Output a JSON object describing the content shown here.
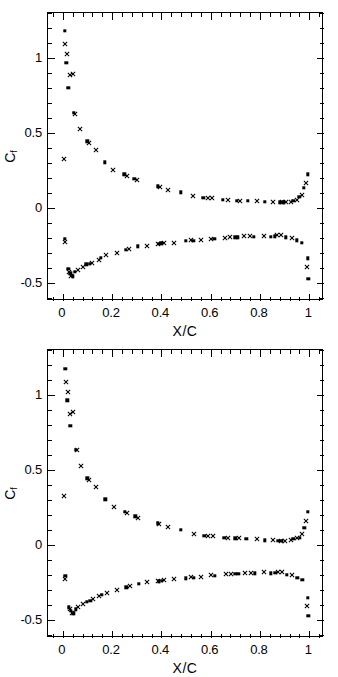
{
  "figure": {
    "background": "#ffffff",
    "foreground": "#000000"
  },
  "chart_data": [
    {
      "type": "scatter",
      "panel": "top",
      "title": "",
      "xlabel": "X/C",
      "ylabel": "Cf",
      "ylabel_base": "C",
      "ylabel_sub": "f",
      "xlim": [
        -0.06,
        1.06
      ],
      "ylim": [
        -0.62,
        1.3
      ],
      "xticks": [
        0,
        0.2,
        0.4,
        0.6,
        0.8,
        1
      ],
      "xticklabels": [
        "0",
        "0.2",
        "0.4",
        "0.6",
        "0.8",
        "1"
      ],
      "yticks": [
        -0.5,
        0,
        0.5,
        1
      ],
      "yticklabels": [
        "-0.5",
        "0",
        "0.5",
        "1"
      ],
      "minor_x_per_major": 5,
      "minor_y_per_major": 5,
      "grid": false,
      "legend": null,
      "series": [
        {
          "name": "squares-upper",
          "marker": "square",
          "points": [
            [
              0.008,
              1.18
            ],
            [
              0.015,
              0.97
            ],
            [
              0.022,
              0.8
            ],
            [
              0.045,
              0.635
            ],
            [
              0.1,
              0.445
            ],
            [
              0.17,
              0.305
            ],
            [
              0.25,
              0.225
            ],
            [
              0.29,
              0.195
            ],
            [
              0.385,
              0.145
            ],
            [
              0.48,
              0.105
            ],
            [
              0.57,
              0.07
            ],
            [
              0.65,
              0.055
            ],
            [
              0.705,
              0.05
            ],
            [
              0.75,
              0.048
            ],
            [
              0.82,
              0.04
            ],
            [
              0.88,
              0.038
            ],
            [
              0.895,
              0.038
            ],
            [
              0.935,
              0.05
            ],
            [
              0.96,
              0.075
            ],
            [
              0.978,
              0.135
            ],
            [
              0.995,
              0.225
            ]
          ]
        },
        {
          "name": "crosses-upper",
          "marker": "cross",
          "points": [
            [
              0.004,
              0.325
            ],
            [
              0.01,
              1.095
            ],
            [
              0.016,
              1.025
            ],
            [
              0.028,
              0.885
            ],
            [
              0.04,
              0.895
            ],
            [
              0.05,
              0.63
            ],
            [
              0.07,
              0.525
            ],
            [
              0.105,
              0.435
            ],
            [
              0.135,
              0.385
            ],
            [
              0.205,
              0.255
            ],
            [
              0.26,
              0.215
            ],
            [
              0.3,
              0.185
            ],
            [
              0.395,
              0.142
            ],
            [
              0.425,
              0.122
            ],
            [
              0.53,
              0.08
            ],
            [
              0.59,
              0.07
            ],
            [
              0.605,
              0.068
            ],
            [
              0.67,
              0.052
            ],
            [
              0.72,
              0.05
            ],
            [
              0.79,
              0.045
            ],
            [
              0.855,
              0.04
            ],
            [
              0.89,
              0.038
            ],
            [
              0.905,
              0.038
            ],
            [
              0.925,
              0.042
            ],
            [
              0.95,
              0.055
            ],
            [
              0.97,
              0.09
            ],
            [
              0.985,
              0.165
            ]
          ]
        },
        {
          "name": "squares-lower",
          "marker": "square",
          "points": [
            [
              0.008,
              -0.205
            ],
            [
              0.022,
              -0.405
            ],
            [
              0.03,
              -0.435
            ],
            [
              0.04,
              -0.455
            ],
            [
              0.05,
              -0.425
            ],
            [
              0.095,
              -0.375
            ],
            [
              0.11,
              -0.37
            ],
            [
              0.155,
              -0.33
            ],
            [
              0.255,
              -0.28
            ],
            [
              0.305,
              -0.255
            ],
            [
              0.39,
              -0.24
            ],
            [
              0.4,
              -0.235
            ],
            [
              0.5,
              -0.22
            ],
            [
              0.53,
              -0.218
            ],
            [
              0.615,
              -0.205
            ],
            [
              0.7,
              -0.195
            ],
            [
              0.71,
              -0.195
            ],
            [
              0.775,
              -0.19
            ],
            [
              0.845,
              -0.19
            ],
            [
              0.86,
              -0.188
            ],
            [
              0.905,
              -0.195
            ],
            [
              0.95,
              -0.215
            ],
            [
              0.97,
              -0.23
            ],
            [
              0.995,
              -0.335
            ],
            [
              0.997,
              -0.47
            ]
          ]
        },
        {
          "name": "crosses-lower",
          "marker": "cross",
          "points": [
            [
              0.008,
              -0.225
            ],
            [
              0.026,
              -0.425
            ],
            [
              0.035,
              -0.45
            ],
            [
              0.06,
              -0.41
            ],
            [
              0.08,
              -0.39
            ],
            [
              0.12,
              -0.365
            ],
            [
              0.145,
              -0.345
            ],
            [
              0.175,
              -0.315
            ],
            [
              0.22,
              -0.3
            ],
            [
              0.27,
              -0.275
            ],
            [
              0.34,
              -0.25
            ],
            [
              0.385,
              -0.243
            ],
            [
              0.41,
              -0.235
            ],
            [
              0.45,
              -0.23
            ],
            [
              0.52,
              -0.215
            ],
            [
              0.56,
              -0.212
            ],
            [
              0.6,
              -0.205
            ],
            [
              0.66,
              -0.198
            ],
            [
              0.68,
              -0.195
            ],
            [
              0.735,
              -0.188
            ],
            [
              0.76,
              -0.188
            ],
            [
              0.815,
              -0.185
            ],
            [
              0.87,
              -0.182
            ],
            [
              0.885,
              -0.182
            ],
            [
              0.93,
              -0.2
            ],
            [
              0.99,
              -0.39
            ]
          ]
        }
      ]
    },
    {
      "type": "scatter",
      "panel": "bottom",
      "title": "",
      "xlabel": "X/C",
      "ylabel": "Cf",
      "ylabel_base": "C",
      "ylabel_sub": "f",
      "xlim": [
        -0.06,
        1.06
      ],
      "ylim": [
        -0.62,
        1.3
      ],
      "xticks": [
        0,
        0.2,
        0.4,
        0.6,
        0.8,
        1
      ],
      "xticklabels": [
        "0",
        "0.2",
        "0.4",
        "0.6",
        "0.8",
        "1"
      ],
      "yticks": [
        -0.5,
        0,
        0.5,
        1
      ],
      "yticklabels": [
        "-0.5",
        "0",
        "0.5",
        "1"
      ],
      "minor_x_per_major": 5,
      "minor_y_per_major": 5,
      "grid": false,
      "legend": null,
      "series": [
        {
          "name": "squares-upper",
          "marker": "square",
          "points": [
            [
              0.01,
              1.175
            ],
            [
              0.018,
              0.965
            ],
            [
              0.03,
              0.795
            ],
            [
              0.052,
              0.635
            ],
            [
              0.1,
              0.445
            ],
            [
              0.172,
              0.305
            ],
            [
              0.252,
              0.222
            ],
            [
              0.295,
              0.192
            ],
            [
              0.385,
              0.145
            ],
            [
              0.48,
              0.1
            ],
            [
              0.575,
              0.062
            ],
            [
              0.655,
              0.05
            ],
            [
              0.7,
              0.045
            ],
            [
              0.745,
              0.042
            ],
            [
              0.82,
              0.032
            ],
            [
              0.875,
              0.03
            ],
            [
              0.89,
              0.03
            ],
            [
              0.935,
              0.042
            ],
            [
              0.962,
              0.048
            ],
            [
              0.98,
              0.115
            ],
            [
              0.995,
              0.222
            ]
          ]
        },
        {
          "name": "crosses-upper",
          "marker": "cross",
          "points": [
            [
              0.004,
              0.325
            ],
            [
              0.012,
              1.09
            ],
            [
              0.02,
              1.02
            ],
            [
              0.028,
              0.875
            ],
            [
              0.042,
              0.885
            ],
            [
              0.058,
              0.632
            ],
            [
              0.072,
              0.525
            ],
            [
              0.105,
              0.435
            ],
            [
              0.135,
              0.385
            ],
            [
              0.208,
              0.255
            ],
            [
              0.262,
              0.212
            ],
            [
              0.305,
              0.182
            ],
            [
              0.392,
              0.142
            ],
            [
              0.428,
              0.118
            ],
            [
              0.532,
              0.072
            ],
            [
              0.59,
              0.062
            ],
            [
              0.61,
              0.06
            ],
            [
              0.67,
              0.048
            ],
            [
              0.715,
              0.045
            ],
            [
              0.79,
              0.038
            ],
            [
              0.855,
              0.032
            ],
            [
              0.885,
              0.03
            ],
            [
              0.9,
              0.03
            ],
            [
              0.928,
              0.035
            ],
            [
              0.952,
              0.045
            ],
            [
              0.972,
              0.075
            ],
            [
              0.988,
              0.16
            ]
          ]
        },
        {
          "name": "squares-lower",
          "marker": "square",
          "points": [
            [
              0.01,
              -0.205
            ],
            [
              0.024,
              -0.415
            ],
            [
              0.032,
              -0.44
            ],
            [
              0.042,
              -0.455
            ],
            [
              0.052,
              -0.428
            ],
            [
              0.098,
              -0.378
            ],
            [
              0.112,
              -0.372
            ],
            [
              0.158,
              -0.332
            ],
            [
              0.258,
              -0.282
            ],
            [
              0.308,
              -0.258
            ],
            [
              0.39,
              -0.242
            ],
            [
              0.402,
              -0.238
            ],
            [
              0.5,
              -0.222
            ],
            [
              0.532,
              -0.218
            ],
            [
              0.618,
              -0.205
            ],
            [
              0.7,
              -0.192
            ],
            [
              0.712,
              -0.192
            ],
            [
              0.778,
              -0.188
            ],
            [
              0.845,
              -0.188
            ],
            [
              0.862,
              -0.186
            ],
            [
              0.908,
              -0.198
            ],
            [
              0.952,
              -0.218
            ],
            [
              0.972,
              -0.232
            ],
            [
              0.995,
              -0.352
            ],
            [
              0.997,
              -0.472
            ]
          ]
        },
        {
          "name": "crosses-lower",
          "marker": "cross",
          "points": [
            [
              0.01,
              -0.228
            ],
            [
              0.028,
              -0.428
            ],
            [
              0.038,
              -0.452
            ],
            [
              0.062,
              -0.412
            ],
            [
              0.082,
              -0.392
            ],
            [
              0.122,
              -0.362
            ],
            [
              0.148,
              -0.342
            ],
            [
              0.178,
              -0.318
            ],
            [
              0.222,
              -0.298
            ],
            [
              0.272,
              -0.272
            ],
            [
              0.342,
              -0.248
            ],
            [
              0.388,
              -0.242
            ],
            [
              0.412,
              -0.235
            ],
            [
              0.452,
              -0.228
            ],
            [
              0.522,
              -0.212
            ],
            [
              0.562,
              -0.21
            ],
            [
              0.602,
              -0.202
            ],
            [
              0.662,
              -0.195
            ],
            [
              0.682,
              -0.192
            ],
            [
              0.738,
              -0.186
            ],
            [
              0.762,
              -0.186
            ],
            [
              0.818,
              -0.182
            ],
            [
              0.872,
              -0.18
            ],
            [
              0.888,
              -0.18
            ],
            [
              0.932,
              -0.2
            ],
            [
              0.992,
              -0.405
            ]
          ]
        }
      ]
    }
  ]
}
